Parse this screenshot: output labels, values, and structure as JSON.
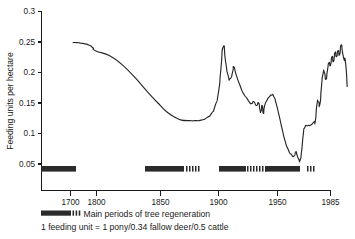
{
  "chart_data": {
    "type": "line",
    "title": "",
    "xlabel": "",
    "ylabel": "Feeding units per hectare",
    "xlim": [
      1670,
      1985
    ],
    "ylim": [
      0.02,
      0.3
    ],
    "grid": false,
    "legend_position": "below-axis",
    "y_ticks": [
      "0.3",
      "0.25",
      "0.2",
      "0.15",
      "0.1",
      "0.05"
    ],
    "y_tick_values": [
      0.3,
      0.25,
      0.2,
      0.15,
      0.1,
      0.05
    ],
    "x_ticks": [
      "1700",
      "1800",
      "1850",
      "1900",
      "1950",
      "1985"
    ],
    "x_tick_values": [
      1700,
      1800,
      1850,
      1900,
      1950,
      1985
    ],
    "x_axis_note": "non-linear: 1670-1800 compressed, 1800-1985 linear",
    "series": [
      {
        "name": "Grazing pressure",
        "points": [
          [
            1710,
            0.249
          ],
          [
            1725,
            0.249
          ],
          [
            1740,
            0.248
          ],
          [
            1755,
            0.247
          ],
          [
            1770,
            0.245
          ],
          [
            1785,
            0.241
          ],
          [
            1800,
            0.235
          ],
          [
            1810,
            0.228
          ],
          [
            1820,
            0.213
          ],
          [
            1830,
            0.192
          ],
          [
            1840,
            0.168
          ],
          [
            1848,
            0.15
          ],
          [
            1855,
            0.136
          ],
          [
            1862,
            0.127
          ],
          [
            1868,
            0.122
          ],
          [
            1875,
            0.121
          ],
          [
            1880,
            0.121
          ],
          [
            1885,
            0.122
          ],
          [
            1890,
            0.126
          ],
          [
            1894,
            0.133
          ],
          [
            1897,
            0.145
          ],
          [
            1900,
            0.168
          ],
          [
            1902,
            0.205
          ],
          [
            1904,
            0.242
          ],
          [
            1906,
            0.218
          ],
          [
            1908,
            0.196
          ],
          [
            1910,
            0.19
          ],
          [
            1912,
            0.201
          ],
          [
            1913,
            0.209
          ],
          [
            1915,
            0.196
          ],
          [
            1918,
            0.18
          ],
          [
            1921,
            0.166
          ],
          [
            1924,
            0.158
          ],
          [
            1926,
            0.152
          ],
          [
            1928,
            0.149
          ],
          [
            1930,
            0.152
          ],
          [
            1932,
            0.146
          ],
          [
            1934,
            0.15
          ],
          [
            1935,
            0.14
          ],
          [
            1936,
            0.136
          ],
          [
            1937,
            0.146
          ],
          [
            1938,
            0.133
          ],
          [
            1939,
            0.145
          ],
          [
            1941,
            0.154
          ],
          [
            1943,
            0.16
          ],
          [
            1945,
            0.163
          ],
          [
            1947,
            0.16
          ],
          [
            1949,
            0.148
          ],
          [
            1951,
            0.13
          ],
          [
            1953,
            0.108
          ],
          [
            1955,
            0.088
          ],
          [
            1957,
            0.074
          ],
          [
            1959,
            0.066
          ],
          [
            1961,
            0.063
          ],
          [
            1962,
            0.07
          ],
          [
            1963,
            0.064
          ],
          [
            1964,
            0.058
          ],
          [
            1965,
            0.057
          ],
          [
            1966,
            0.073
          ],
          [
            1967,
            0.098
          ],
          [
            1968,
            0.11
          ],
          [
            1970,
            0.113
          ],
          [
            1972,
            0.114
          ],
          [
            1974,
            0.119
          ],
          [
            1975,
            0.121
          ],
          [
            1976,
            0.147
          ],
          [
            1977,
            0.152
          ],
          [
            1978,
            0.148
          ],
          [
            1979,
            0.176
          ],
          [
            1980,
            0.197
          ],
          [
            1981,
            0.2
          ],
          [
            1982,
            0.189
          ],
          [
            1983,
            0.204
          ],
          [
            1984,
            0.216
          ],
          [
            1985,
            0.212
          ],
          [
            1986,
            0.226
          ],
          [
            1987,
            0.218
          ],
          [
            1988,
            0.233
          ],
          [
            1989,
            0.226
          ],
          [
            1990,
            0.236
          ],
          [
            1991,
            0.229
          ],
          [
            1992,
            0.245
          ],
          [
            1993,
            0.232
          ],
          [
            1994,
            0.221
          ],
          [
            1995,
            0.215
          ],
          [
            1996,
            0.177
          ]
        ]
      }
    ],
    "annotations": {
      "peak_1883": 0.242,
      "peak_1892": 0.209,
      "plateau_min": 0.121,
      "trough_1940": 0.057,
      "final_value": 0.177
    }
  },
  "regeneration_bands": {
    "label": "Main periods of tree regeneration",
    "solid_segments": [
      {
        "x": 41,
        "w": 35
      },
      {
        "x": 145,
        "w": 39
      },
      {
        "x": 219,
        "w": 27
      },
      {
        "x": 265,
        "w": 35
      }
    ],
    "dashed_segments": [
      {
        "x": 186,
        "count": 5
      },
      {
        "x": 247,
        "count": 7
      },
      {
        "x": 307,
        "count": 3
      }
    ]
  },
  "legend": {
    "regeneration_label": "Main periods of tree regeneration",
    "footnote": "1 feeding unit = 1 pony/0.34 fallow deer/0.5 cattle"
  },
  "axis": {
    "y_title": "Feeding units per hectare"
  },
  "colors": {
    "curve": "#262626",
    "bars": "#2b2b2b",
    "axis": "#1a1a1a",
    "background": "#ffffff"
  }
}
